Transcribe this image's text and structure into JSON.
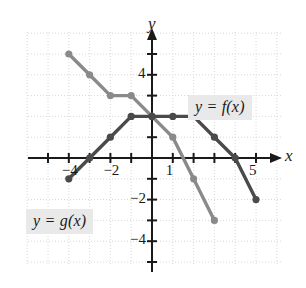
{
  "figure": {
    "background_color": "#ffffff",
    "grid_color": "#d8d8d8",
    "axis_color": "#1a1a1a",
    "axis_labels": {
      "x": "x",
      "y": "y"
    },
    "x_ticks": [
      {
        "value": -4,
        "label": "−4"
      },
      {
        "value": -2,
        "label": "−2"
      },
      {
        "value": 1,
        "label": "1"
      },
      {
        "value": 5,
        "label": "5"
      }
    ],
    "y_ticks": [
      {
        "value": 4,
        "label": "4"
      },
      {
        "value": -2,
        "label": "−2"
      },
      {
        "value": -4,
        "label": "−4"
      }
    ],
    "xlim": [
      -5.2,
      6.2
    ],
    "ylim": [
      -5.4,
      6.0
    ],
    "grid": true,
    "callouts": [
      {
        "name": "f-label",
        "text": "y = f(x)",
        "color": "#1a1a1a",
        "background": "#e9e9e9"
      },
      {
        "name": "g-label",
        "text": "y = g(x)",
        "color": "#1a1a1a",
        "background": "#e9e9e9"
      }
    ]
  },
  "chart_data": {
    "type": "line",
    "title": "",
    "xlabel": "x",
    "ylabel": "y",
    "xlim": [
      -5.2,
      6.2
    ],
    "ylim": [
      -5.4,
      6.0
    ],
    "grid": true,
    "legend_position": "inline-callout",
    "series": [
      {
        "name": "y = f(x)",
        "color": "#4a4a4a",
        "marker": "filled-circle",
        "points": [
          {
            "x": -4,
            "y": -1
          },
          {
            "x": -3,
            "y": 0
          },
          {
            "x": -2,
            "y": 1
          },
          {
            "x": -1,
            "y": 2
          },
          {
            "x": 0,
            "y": 2
          },
          {
            "x": 1,
            "y": 2
          },
          {
            "x": 2,
            "y": 2
          },
          {
            "x": 3,
            "y": 1
          },
          {
            "x": 4,
            "y": 0
          },
          {
            "x": 5,
            "y": -2
          }
        ]
      },
      {
        "name": "y = g(x)",
        "color": "#8a8a8a",
        "marker": "filled-circle",
        "points": [
          {
            "x": -4,
            "y": 5
          },
          {
            "x": -3,
            "y": 4
          },
          {
            "x": -2,
            "y": 3
          },
          {
            "x": -1,
            "y": 3
          },
          {
            "x": 0,
            "y": 2
          },
          {
            "x": 1,
            "y": 1
          },
          {
            "x": 2,
            "y": -1
          },
          {
            "x": 3,
            "y": -3
          }
        ]
      }
    ]
  }
}
